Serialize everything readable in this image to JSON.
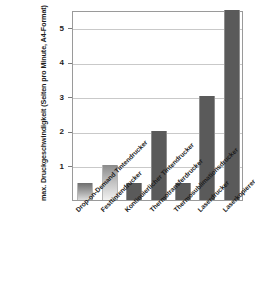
{
  "chart_data": {
    "type": "bar",
    "title": "",
    "subtitle": "",
    "xlabel": "",
    "ylabel": "max. Druckgeschwindigkeit (Seiten pro Minute, A4-Format)",
    "categories": [
      "Drop-on-Demand Tintendrucker",
      "Festtintendrucker",
      "Kontinuierlicher Tintendrucker",
      "Thermotransferdrucker",
      "Thermosublimationsdrucker",
      "Laserdrucker",
      "Laserkopierer"
    ],
    "values": [
      0.5,
      1,
      0.5,
      2,
      0.5,
      3,
      5.5
    ],
    "ylim": [
      0,
      5.5
    ],
    "yticks": [
      1,
      2,
      3,
      4,
      5
    ],
    "ytick_labels": [
      "1",
      "2",
      "3",
      "4",
      "5"
    ],
    "grid": true,
    "legend": false,
    "bar_color": "#5a5a5a",
    "grid_color": "#c9c9c9",
    "axis_color": "#9a9a9a",
    "background": "#ffffff"
  }
}
